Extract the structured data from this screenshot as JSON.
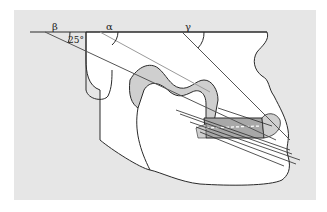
{
  "figure": {
    "type": "anatomical-diagram",
    "colors": {
      "background": "#ffffff",
      "panel": "#e6e6e6",
      "bone_fill": "#ffffff",
      "outline": "#2a2a2a",
      "shaded_region": "#a8a8a8",
      "light_shade": "#cfcfcf",
      "ray_line": "#555555",
      "ray_light": "#9a9a9a"
    },
    "labels": {
      "beta": "β",
      "alpha": "α",
      "gamma": "γ",
      "angle_value": "25°"
    }
  }
}
